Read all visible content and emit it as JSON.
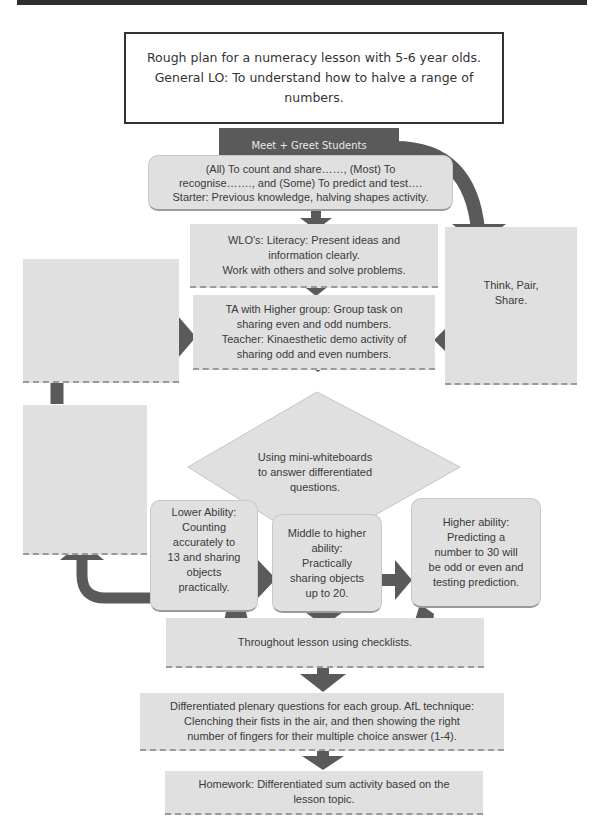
{
  "title": {
    "lines": [
      "Rough plan for a numeracy lesson with 5-6 year olds.",
      "General LO: To understand how to halve a range of numbers."
    ]
  },
  "nodes": {
    "meet_greet": "Meet + Greet  Students",
    "objectives": [
      "(All) To count and share……, (Most) To",
      "recognise……., and (Some) To predict and test….",
      "Starter: Previous knowledge, halving shapes activity."
    ],
    "wlo": [
      "WLO's: Literacy: Present ideas and",
      "information clearly.",
      "Work with others and solve problems."
    ],
    "think_pair_share": [
      "Think, Pair,",
      "Share."
    ],
    "ta_teacher": [
      "TA with Higher group: Group task on",
      "sharing even and odd numbers.",
      "Teacher: Kinaesthetic demo activity of",
      "sharing odd and even numbers."
    ],
    "left_top_box": "",
    "left_bottom_box": "",
    "decision": [
      "Using mini-whiteboards",
      "to answer differentiated",
      "questions."
    ],
    "lower_ability": [
      "Lower Ability:",
      "Counting",
      "accurately to",
      "13 and sharing",
      "objects",
      "practically."
    ],
    "middle_ability": [
      "Middle to higher",
      "ability:",
      "Practically",
      "sharing objects",
      "up to 20."
    ],
    "higher_ability": [
      "Higher ability:",
      "Predicting a",
      "number to 30 will",
      "be odd or even and",
      "testing prediction."
    ],
    "checklists": "Throughout lesson using checklists.",
    "plenary": [
      "Differentiated plenary questions for each group. AfL technique:",
      "Clenching their fists in the air, and then showing the right",
      "number of fingers for their multiple choice answer (1-4)."
    ],
    "homework": [
      "Homework: Differentiated sum activity based on the",
      "lesson topic."
    ]
  },
  "colors": {
    "box_fill": "#e0e0e0",
    "arrow": "#5a5a5a",
    "header_fill": "#5a5a5a",
    "title_border": "#333333"
  }
}
